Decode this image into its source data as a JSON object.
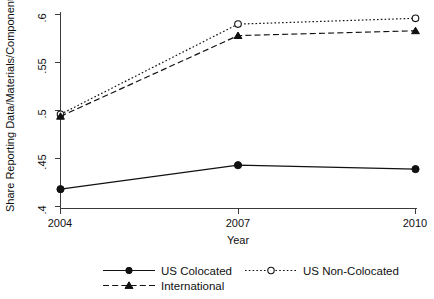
{
  "chart_data": {
    "type": "line",
    "title": "",
    "xlabel": "Year",
    "ylabel": "Share Reporting Data/Materials/Components",
    "x": [
      2004,
      2007,
      2010
    ],
    "xtick_labels": [
      "2004",
      "2007",
      "2010"
    ],
    "ytick_labels": [
      ".4",
      ".45",
      ".5",
      ".55",
      ".6"
    ],
    "ytick_values": [
      0.4,
      0.45,
      0.5,
      0.55,
      0.6
    ],
    "xlim": [
      2004,
      2010
    ],
    "ylim": [
      0.4,
      0.6
    ],
    "grid": false,
    "legend_position": "bottom",
    "series": [
      {
        "name": "US Colocated",
        "values": [
          0.418,
          0.443,
          0.439
        ],
        "line_style": "solid",
        "marker": "filled-circle",
        "color": "#111111"
      },
      {
        "name": "US Non-Colocated",
        "values": [
          0.496,
          0.59,
          0.596
        ],
        "line_style": "dotted",
        "marker": "hollow-circle",
        "color": "#111111"
      },
      {
        "name": "International",
        "values": [
          0.494,
          0.578,
          0.583
        ],
        "line_style": "dashed",
        "marker": "filled-triangle",
        "color": "#111111"
      }
    ]
  },
  "legend": {
    "items": [
      {
        "label": "US Colocated"
      },
      {
        "label": "US Non-Colocated"
      },
      {
        "label": "International"
      }
    ]
  }
}
